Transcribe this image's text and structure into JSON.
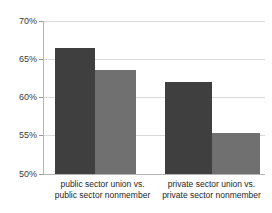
{
  "chart_data": {
    "type": "bar",
    "title": "",
    "subtitle": "",
    "xlabel": "",
    "ylabel": "",
    "ylim": [
      50,
      70
    ],
    "ytick_values": [
      50,
      55,
      60,
      65,
      70
    ],
    "ytick_labels": [
      "50%",
      "55%",
      "60%",
      "65%",
      "70%"
    ],
    "grid": true,
    "legend": "none",
    "categories": [
      "public sector union vs. public sector nonmember",
      "private sector union vs. private sector nonmember"
    ],
    "category_label_lines": [
      [
        "public sector union vs.",
        "public sector nonmember"
      ],
      [
        "private sector union vs.",
        "private sector nonmember"
      ]
    ],
    "series": [
      {
        "name": "union",
        "color": "#3f3f3f",
        "values": [
          66.5,
          62.0
        ]
      },
      {
        "name": "nonmember",
        "color": "#707070",
        "values": [
          63.6,
          55.4
        ]
      }
    ],
    "bars": [
      {
        "group": 0,
        "series": 0,
        "value": 66.5,
        "label": "public sector union",
        "color": "#3f3f3f"
      },
      {
        "group": 0,
        "series": 1,
        "value": 63.6,
        "label": "public sector nonmember",
        "color": "#707070"
      },
      {
        "group": 1,
        "series": 0,
        "value": 62.0,
        "label": "private sector union",
        "color": "#3f3f3f"
      },
      {
        "group": 1,
        "series": 1,
        "value": 55.4,
        "label": "private sector nonmember",
        "color": "#707070"
      }
    ],
    "colors": {
      "background": "#ffffff",
      "gridline": "#d9d9d9",
      "axis": "#b4b4b4",
      "tick_text": "#3a3a3a",
      "bar_dark": "#3f3f3f",
      "bar_light": "#707070"
    }
  }
}
